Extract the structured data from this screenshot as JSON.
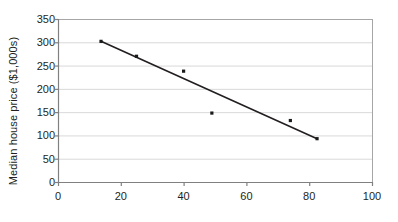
{
  "chart_data": {
    "type": "scatter",
    "title": "",
    "xlabel": "",
    "ylabel": "Median house price ($1,000s)",
    "xlim": [
      0,
      100
    ],
    "ylim": [
      0,
      350
    ],
    "xticks": [
      0,
      20,
      40,
      60,
      80,
      100
    ],
    "yticks": [
      0,
      50,
      100,
      150,
      200,
      250,
      300,
      350
    ],
    "grid": "horizontal",
    "legend": "none",
    "marker_color": "#1a1a1a",
    "line_color": "#231f20",
    "grid_color": "#d9d9d9",
    "axis_color": "#808080",
    "points": [
      {
        "x": 13.7,
        "y": 302
      },
      {
        "x": 25.0,
        "y": 270
      },
      {
        "x": 40.0,
        "y": 238
      },
      {
        "x": 49.0,
        "y": 148
      },
      {
        "x": 74.0,
        "y": 132
      },
      {
        "x": 82.5,
        "y": 93
      }
    ],
    "trendline": {
      "name": "fitted line",
      "x": [
        13.7,
        82.5
      ],
      "y": [
        302,
        93
      ]
    }
  }
}
